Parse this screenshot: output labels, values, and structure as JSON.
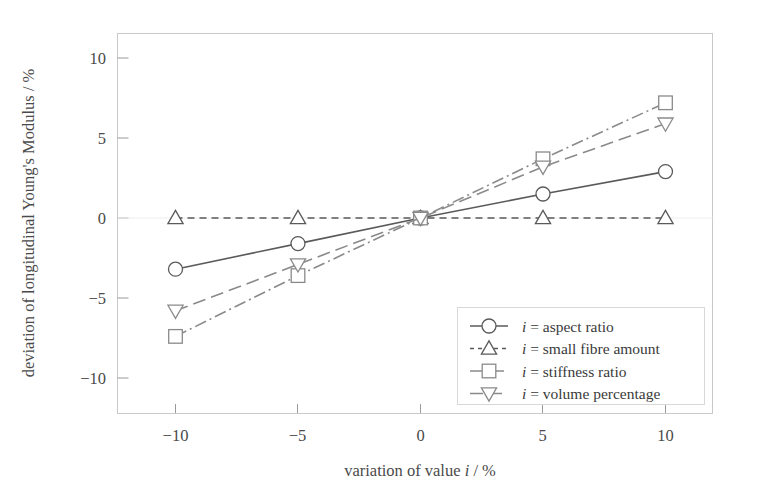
{
  "chart_data": {
    "type": "line",
    "title": "",
    "xlabel": "variation of value i / %",
    "ylabel": "deviation of longitudinal Young's Modulus / %",
    "x": [
      -10,
      -5,
      0,
      5,
      10
    ],
    "xlim": [
      -12.5,
      12.5
    ],
    "ylim": [
      -12,
      12
    ],
    "xticks": [
      -10,
      -5,
      0,
      5,
      10
    ],
    "yticks": [
      -10,
      -5,
      0,
      5,
      10
    ],
    "xticklabels": [
      "−10",
      "−5",
      "0",
      "5",
      "10"
    ],
    "yticklabels": [
      "−10",
      "−5",
      "0",
      "5",
      "10"
    ],
    "grid": false,
    "legend_position": "lower right",
    "series": [
      {
        "name": "i = aspect ratio",
        "marker": "circle",
        "linestyle": "solid",
        "color": "#5a5a5a",
        "values": [
          -3.2,
          -1.6,
          0.0,
          1.5,
          2.9
        ]
      },
      {
        "name": "i = small fibre amount",
        "marker": "triangle-up",
        "linestyle": "dashed",
        "color": "#5a5a5a",
        "values": [
          0.0,
          0.0,
          0.0,
          0.0,
          0.0
        ]
      },
      {
        "name": "i = stiffness ratio",
        "marker": "square",
        "linestyle": "dash-dot",
        "color": "#8a8a8a",
        "values": [
          -7.4,
          -3.6,
          0.0,
          3.7,
          7.2
        ]
      },
      {
        "name": "i = volume percentage",
        "marker": "triangle-down",
        "linestyle": "long-dash",
        "color": "#8a8a8a",
        "values": [
          -5.8,
          -2.9,
          0.0,
          3.2,
          5.9
        ]
      }
    ]
  },
  "axes": {
    "y_title": "deviation of longitudinal Young's Modulus / %",
    "x_title_parts": {
      "pre": "variation of value ",
      "ital": "i",
      "post": " / %"
    }
  },
  "legend": {
    "items": [
      {
        "prefix": "i",
        "label": " = aspect ratio",
        "marker": "circle-icon",
        "linestyle": "solid"
      },
      {
        "prefix": "i",
        "label": " = small fibre amount",
        "marker": "triangle-up-icon",
        "linestyle": "dashed"
      },
      {
        "prefix": "i",
        "label": " = stiffness ratio",
        "marker": "square-icon",
        "linestyle": "dash-dot"
      },
      {
        "prefix": "i",
        "label": " = volume percentage",
        "marker": "triangle-down-icon",
        "linestyle": "long-dash"
      }
    ]
  },
  "ticks": {
    "y": [
      "10",
      "5",
      "0",
      "−5",
      "−10"
    ],
    "x": [
      "−10",
      "−5",
      "0",
      "5",
      "10"
    ]
  },
  "colors": {
    "dark": "#5a5a5a",
    "light": "#8a8a8a",
    "frame": "#c8c8c8",
    "text": "#4a4a4a"
  }
}
